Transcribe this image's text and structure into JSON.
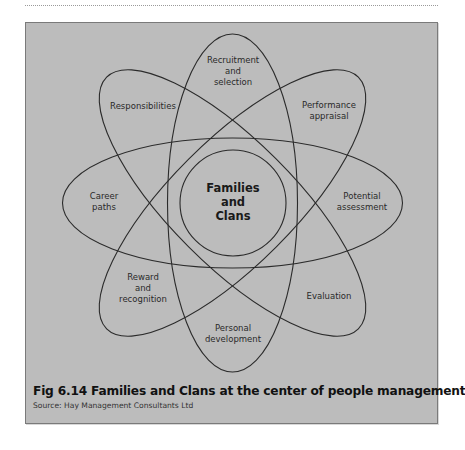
{
  "figure": {
    "number_and_title": "Fig 6.14  Families and Clans at the center of people management",
    "source": "Source: Hay Management Consultants Ltd"
  },
  "diagram": {
    "type": "atom-orbit diagram",
    "center": {
      "label_lines": [
        "Families",
        "and",
        "Clans"
      ]
    },
    "orbits": [
      {
        "orientation_deg": 0,
        "ends": [
          "Career paths",
          "Potential assessment"
        ]
      },
      {
        "orientation_deg": 90,
        "ends": [
          "Recruitment and selection",
          "Personal development"
        ]
      },
      {
        "orientation_deg": 45,
        "ends": [
          "Performance appraisal",
          "Reward and recognition"
        ]
      },
      {
        "orientation_deg": 135,
        "ends": [
          "Responsibilities",
          "Evaluation"
        ]
      }
    ],
    "labels": {
      "recruitment": [
        "Recruitment",
        "and",
        "selection"
      ],
      "responsibilities": [
        "Responsibilities"
      ],
      "performance": [
        "Performance",
        "appraisal"
      ],
      "career": [
        "Career",
        "paths"
      ],
      "potential": [
        "Potential",
        "assessment"
      ],
      "reward": [
        "Reward",
        "and",
        "recognition"
      ],
      "evaluation": [
        "Evaluation"
      ],
      "personal": [
        "Personal",
        "development"
      ]
    }
  },
  "colors": {
    "panel_background": "#bcbcbc",
    "line": "#2b2b2b",
    "text": "#2a2a2a"
  }
}
